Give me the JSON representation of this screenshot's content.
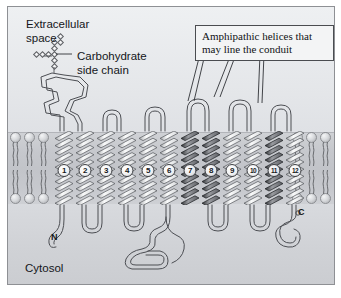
{
  "figure": {
    "width": 341,
    "height": 298,
    "background": "#ffffff"
  },
  "regions": {
    "extracellular": {
      "label": "Extracellular\nspace",
      "line1": "Extracellular",
      "line2": "space"
    },
    "membrane": {
      "label": "lipid bilayer"
    },
    "cytosol": {
      "label": "Cytosol"
    }
  },
  "labels": {
    "carbohydrate": {
      "line1": "Carbohydrate",
      "line2": "side chain"
    },
    "n_terminus": "N",
    "c_terminus": "C"
  },
  "callout": {
    "line1": "Amphipathic helices that",
    "line2": "may line the conduit",
    "points_to": [
      7,
      8,
      11
    ]
  },
  "helices": [
    {
      "number": "1",
      "shade": "light",
      "x": 47
    },
    {
      "number": "2",
      "shade": "light",
      "x": 68
    },
    {
      "number": "3",
      "shade": "light",
      "x": 89
    },
    {
      "number": "4",
      "shade": "light",
      "x": 110
    },
    {
      "number": "5",
      "shade": "light",
      "x": 131
    },
    {
      "number": "6",
      "shade": "light",
      "x": 152
    },
    {
      "number": "7",
      "shade": "dark",
      "x": 173
    },
    {
      "number": "8",
      "shade": "dark",
      "x": 194
    },
    {
      "number": "9",
      "shade": "light",
      "x": 215
    },
    {
      "number": "10",
      "shade": "light",
      "x": 236
    },
    {
      "number": "11",
      "shade": "dark",
      "x": 257
    },
    {
      "number": "12",
      "shade": "light",
      "x": 278
    }
  ],
  "colors": {
    "frame_border": "#8e9094",
    "extracellular_bg": "#e8eaed",
    "membrane_bg": "#c4c6cb",
    "cytosol_bg": "#d2d4d8",
    "helix_light": "#dcdee1",
    "helix_dark": "#5a5c61",
    "ribbon_stroke": "#4c4e53",
    "text": "#14161a"
  },
  "counts": {
    "transmembrane_helices": 12,
    "amphipathic_helices": 3
  }
}
